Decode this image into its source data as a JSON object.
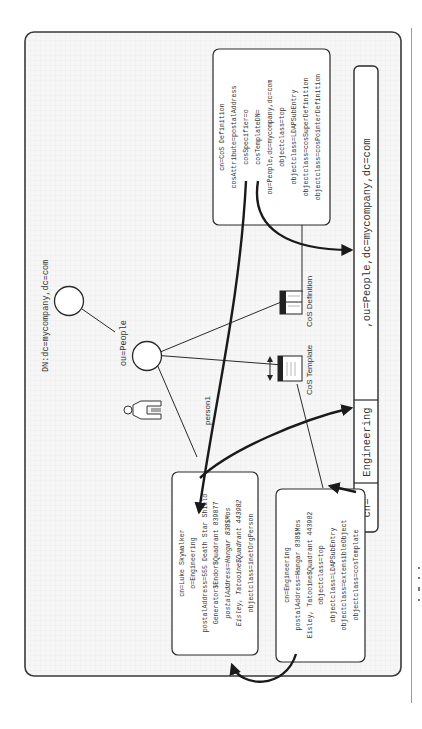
{
  "diagram": {
    "orientation": "rotated-90-ccw",
    "root": {
      "label": "DN:dc=mycompany,dc=com"
    },
    "ou_node": {
      "label": "ou=People"
    },
    "person": {
      "label": "person1"
    },
    "cos_template_icon": {
      "label": "CoS Template"
    },
    "cos_definition_icon": {
      "label": "CoS Definition"
    },
    "cos_definition_entry": {
      "lines": [
        "cn=CoS Definition",
        "cosAttribute=postalAddress",
        "cosSpecifier=o",
        "cosTemplateDN=",
        "ou=People,dc=mycompany,dc=com",
        "objectclass=top",
        "objectclass=LDAPSubEntry",
        "objectclass=cosSuperDefinition",
        "objectclass=cosPointerDefinition"
      ]
    },
    "person_entry": {
      "lines": [
        "cn=Luke Skywalker",
        "o=Engineering",
        "postalAddress=555 Death Star Shield",
        "Generator$Endor$Quadrant 839077",
        "postalAddress=Hangar 838$Mos",
        "Eisley, Tatooine$Quadrant 443982",
        "objectclass=inetOrgPerson"
      ],
      "italic_lines": [
        4,
        5
      ]
    },
    "template_entry": {
      "lines": [
        "cn=Engineering",
        "postalAddress=Hangar 838$Mos",
        "Eisley, Tatooine$Quadrant 443982",
        "objectclass=top",
        "objectclass=LDAPSubEntry",
        "objectclass=extensibleObject",
        "objectclass=cosTemplate"
      ]
    },
    "template_dn_bar": {
      "segments": [
        "cn=",
        "Engineering",
        ",ou=People,dc=mycompany,dc=com"
      ]
    }
  },
  "colors": {
    "frame_border": "#3a3a3a",
    "frame_fill": "#f4f4f4",
    "grid": "#e6e6e6",
    "box_fill": "#ffffff",
    "text": "#333333",
    "arrow": "#1a1a1a"
  }
}
